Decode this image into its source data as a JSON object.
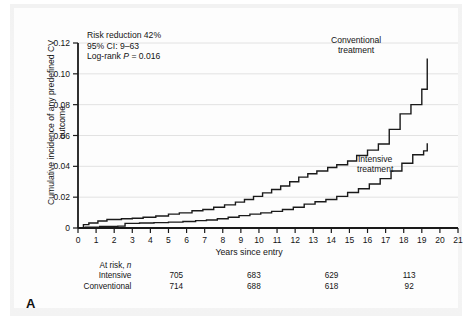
{
  "figure": {
    "panel_letter": "A"
  },
  "annotation": {
    "line1": "Risk reduction 42%",
    "line2": "95% CI: 9–63",
    "line3_prefix": "Log-rank ",
    "line3_italic": "P",
    "line3_suffix": " = 0.016"
  },
  "curve_labels": {
    "conventional_line1": "Conventional",
    "conventional_line2": "treatment",
    "intensive_line1": "Intensive",
    "intensive_line2": "treatment"
  },
  "at_risk": {
    "header": "At risk, ",
    "header_italic": "n",
    "rows": [
      {
        "label": "Intensive",
        "values": [
          "705",
          "683",
          "629",
          "113"
        ]
      },
      {
        "label": "Conventional",
        "values": [
          "714",
          "688",
          "618",
          "92"
        ]
      }
    ]
  },
  "chart_data": {
    "type": "line",
    "subtype": "kaplan-meier-cumulative-incidence",
    "title": "",
    "xlabel": "Years since entry",
    "ylabel": "Cumulative incidence of any predefined CV outcome",
    "xlim": [
      0,
      21
    ],
    "ylim": [
      0,
      0.12
    ],
    "xticks": [
      0,
      1,
      2,
      3,
      4,
      5,
      6,
      7,
      8,
      9,
      10,
      11,
      12,
      13,
      14,
      15,
      16,
      17,
      18,
      19,
      20,
      21
    ],
    "xtick_labels": [
      "0",
      "1",
      "2",
      "3",
      "4",
      "5",
      "6",
      "7",
      "8",
      "9",
      "10",
      "11",
      "12",
      "13",
      "14",
      "15",
      "16",
      "17",
      "18",
      "19",
      "20",
      "21"
    ],
    "yticks": [
      0,
      0.02,
      0.04,
      0.06,
      0.08,
      0.1,
      0.12
    ],
    "ytick_labels": [
      "0",
      "0.02",
      "0.04",
      "0.06",
      "0.08",
      "0.10",
      "0.12"
    ],
    "grid": "horizontal",
    "legend": "inline-annotations",
    "statistics": {
      "risk_reduction_percent": 42,
      "ci_95_low": 9,
      "ci_95_high": 63,
      "log_rank_p": 0.016
    },
    "series": [
      {
        "name": "Conventional treatment",
        "step": "post",
        "x": [
          0,
          0.3,
          0.6,
          1.1,
          1.6,
          2.4,
          3.0,
          3.6,
          4.3,
          5.0,
          5.6,
          6.3,
          6.9,
          7.5,
          8.1,
          8.7,
          9.2,
          9.7,
          10.2,
          10.7,
          11.2,
          11.7,
          12.2,
          12.7,
          13.2,
          13.8,
          14.3,
          14.9,
          15.4,
          16.0,
          16.6,
          17.2,
          17.8,
          18.4,
          19.0,
          19.3
        ],
        "y": [
          0,
          0.0022,
          0.0032,
          0.0045,
          0.0055,
          0.006,
          0.0063,
          0.007,
          0.0078,
          0.009,
          0.0098,
          0.0112,
          0.012,
          0.0135,
          0.015,
          0.0168,
          0.0185,
          0.0205,
          0.0228,
          0.025,
          0.0272,
          0.03,
          0.033,
          0.0352,
          0.037,
          0.0392,
          0.041,
          0.0435,
          0.047,
          0.0505,
          0.0545,
          0.064,
          0.074,
          0.08,
          0.09,
          0.11
        ]
      },
      {
        "name": "Intensive treatment",
        "step": "post",
        "x": [
          0,
          0.4,
          1.2,
          2.2,
          2.6,
          3.4,
          4.2,
          5.0,
          5.8,
          6.5,
          7.1,
          7.7,
          8.3,
          8.9,
          9.5,
          10.1,
          10.7,
          11.3,
          11.9,
          12.5,
          13.1,
          13.7,
          14.3,
          14.9,
          15.5,
          16.1,
          16.7,
          17.3,
          17.9,
          18.5,
          19.1,
          19.3
        ],
        "y": [
          0,
          0.0005,
          0.001,
          0.0012,
          0.003,
          0.0032,
          0.0035,
          0.0038,
          0.0042,
          0.0048,
          0.0052,
          0.006,
          0.007,
          0.008,
          0.009,
          0.0098,
          0.0108,
          0.012,
          0.0135,
          0.0155,
          0.017,
          0.0185,
          0.0205,
          0.023,
          0.0255,
          0.0285,
          0.032,
          0.037,
          0.042,
          0.0475,
          0.05,
          0.055
        ]
      }
    ],
    "at_risk_table": {
      "row_header": "At risk, n",
      "time_points": [
        0,
        5,
        10,
        15
      ],
      "rows": [
        {
          "name": "Intensive",
          "values": [
            705,
            683,
            629,
            113
          ]
        },
        {
          "name": "Conventional",
          "values": [
            714,
            688,
            618,
            92
          ]
        }
      ]
    }
  }
}
